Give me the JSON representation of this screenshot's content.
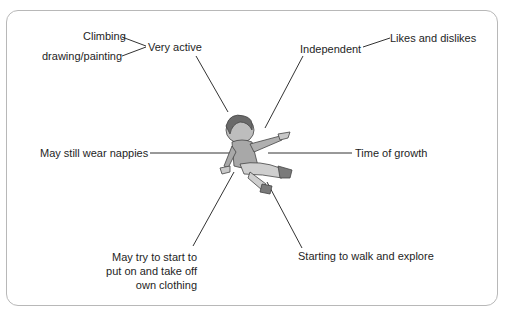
{
  "diagram": {
    "center": {
      "name": "Toddler",
      "image": "toddler-illustration"
    },
    "nodes": [
      {
        "id": "very_active",
        "label": "Very active",
        "sub": [
          "Climbing",
          "drawing/painting"
        ]
      },
      {
        "id": "independent",
        "label": "Independent",
        "sub": [
          "Likes and dislikes"
        ]
      },
      {
        "id": "nappies",
        "label": "May still wear nappies"
      },
      {
        "id": "growth",
        "label": "Time of growth"
      },
      {
        "id": "clothing",
        "label_lines": [
          "May try to start to",
          "put on and take off",
          "own clothing"
        ]
      },
      {
        "id": "walk",
        "label": "Starting to walk and explore"
      }
    ]
  },
  "colors": {
    "line": "#333333",
    "border": "#b8b8b8",
    "text": "#1e1e1e"
  }
}
